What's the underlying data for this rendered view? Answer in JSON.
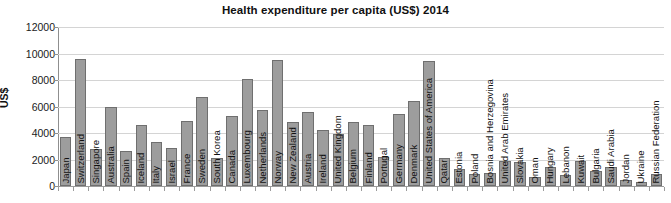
{
  "chart_data": {
    "type": "bar",
    "title": "Health expenditure per capita (US$) 2014",
    "xlabel": "",
    "ylabel": "US$",
    "ylim": [
      0,
      12000
    ],
    "ytick_values": [
      12000,
      10000,
      8000,
      6000,
      4000,
      2000,
      0
    ],
    "ytick_labels": [
      "12000",
      "10000",
      "8000",
      "6000",
      "4000",
      "2000",
      "0"
    ],
    "grid": true,
    "legend": null,
    "bar_color": "#9d9d9d",
    "bar_edge_color": "#6f6f6f",
    "categories": [
      "Japan",
      "Switzerland",
      "Singapore",
      "Australia",
      "Spain",
      "Iceland",
      "Italy",
      "Israel",
      "France",
      "Sweden",
      "South Korea",
      "Canada",
      "Luxembourg",
      "Netherlands",
      "Norway",
      "New Zealand",
      "Austria",
      "Ireland",
      "United Kingdom",
      "Belgium",
      "Finland",
      "Portugal",
      "Germany",
      "Denmark",
      "United States of America",
      "Qatar",
      "Estonia",
      "Poland",
      "Bosnia and Herzegovina",
      "United Arab Emirates",
      "Slovakia",
      "Oman",
      "Hungary",
      "Lebanon",
      "Kuwait",
      "Bulgaria",
      "Saudi Arabia",
      "Jordan",
      "Ukraine",
      "Russian Federation"
    ],
    "values": [
      3700,
      9600,
      2800,
      6000,
      2650,
      4600,
      3300,
      2900,
      4900,
      6700,
      2100,
      5300,
      8100,
      5700,
      9500,
      4850,
      5550,
      4250,
      3900,
      4800,
      4600,
      2200,
      5400,
      6450,
      9400,
      2100,
      1250,
      900,
      950,
      1900,
      1850,
      700,
      1450,
      800,
      1900,
      1100,
      1450,
      450,
      300,
      900
    ]
  }
}
